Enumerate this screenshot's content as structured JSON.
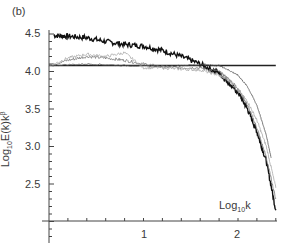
{
  "chart_data": {
    "type": "line",
    "panel_label": "(b)",
    "title": "",
    "xlabel": "Log10k",
    "ylabel": "Log10E(k)k^β",
    "xlim": [
      0,
      2.4
    ],
    "ylim": [
      2.0,
      4.55
    ],
    "x_ticks": [
      1,
      2
    ],
    "y_ticks": [
      2.5,
      3.0,
      3.5,
      4.0,
      4.5
    ],
    "grid": false,
    "legend": null,
    "reference_line": {
      "y": 4.08,
      "x_range": [
        0,
        2.4
      ],
      "color": "#222222"
    },
    "series": [
      {
        "name": "spectrum A (dense black)",
        "color": "#111111",
        "x": [
          0.05,
          0.2,
          0.4,
          0.6,
          0.8,
          1.0,
          1.2,
          1.4,
          1.6,
          1.8,
          1.9,
          2.0,
          2.1,
          2.2,
          2.3,
          2.4
        ],
        "values": [
          4.48,
          4.47,
          4.45,
          4.4,
          4.36,
          4.34,
          4.28,
          4.2,
          4.1,
          3.98,
          3.85,
          3.72,
          3.5,
          3.2,
          2.8,
          2.15
        ]
      },
      {
        "name": "spectrum B (grey)",
        "color": "#777777",
        "x": [
          0.0,
          0.2,
          0.4,
          0.6,
          0.8,
          1.0,
          1.2,
          1.4,
          1.6,
          1.8,
          1.9,
          2.0,
          2.1,
          2.2,
          2.3,
          2.4
        ],
        "values": [
          4.08,
          4.15,
          4.2,
          4.18,
          4.15,
          4.1,
          4.06,
          4.05,
          4.05,
          4.0,
          3.9,
          3.78,
          3.55,
          3.25,
          2.85,
          2.3
        ]
      },
      {
        "name": "spectrum C (light grey)",
        "color": "#aaaaaa",
        "x": [
          0.0,
          0.2,
          0.4,
          0.6,
          0.8,
          1.0,
          1.2,
          1.4,
          1.6,
          1.8,
          1.9,
          2.0,
          2.1,
          2.2,
          2.3,
          2.4
        ],
        "values": [
          4.07,
          4.18,
          4.23,
          4.2,
          4.25,
          4.05,
          4.05,
          4.03,
          4.02,
          3.95,
          3.88,
          3.75,
          3.6,
          3.35,
          3.0,
          2.45
        ]
      },
      {
        "name": "spectrum D (thin dark, rightmost)",
        "color": "#555555",
        "x": [
          0.0,
          0.4,
          0.8,
          1.2,
          1.6,
          1.8,
          1.9,
          2.0,
          2.1,
          2.2,
          2.3,
          2.35
        ],
        "values": [
          4.08,
          4.1,
          4.08,
          4.07,
          4.09,
          4.08,
          4.02,
          3.95,
          3.8,
          3.55,
          3.15,
          2.85
        ]
      }
    ]
  },
  "labels": {
    "panel": "(b)",
    "y_ticks": [
      "4.5",
      "4.0",
      "3.5",
      "3.0",
      "2.5"
    ],
    "x_ticks": [
      "1",
      "2"
    ],
    "ylabel_main": "Log",
    "ylabel_sub": "10",
    "ylabel_mid": "E(k)k",
    "ylabel_sup": "β",
    "xlabel_main": "Log",
    "xlabel_sub": "10",
    "xlabel_end": "k"
  }
}
